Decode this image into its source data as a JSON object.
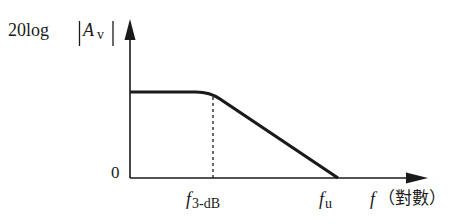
{
  "diagram": {
    "type": "frequency-response-bode-magnitude",
    "y_axis": {
      "label_prefix": "20log",
      "label_var": "A",
      "label_sub": "v",
      "zero_label": "0"
    },
    "x_axis": {
      "label_var": "f",
      "label_unit": "（對數）",
      "ticks": [
        {
          "var": "f",
          "sub": "3-dB"
        },
        {
          "var": "f",
          "sub": "u"
        }
      ]
    },
    "colors": {
      "line": "#1a1a1a",
      "background": "#ffffff"
    }
  }
}
